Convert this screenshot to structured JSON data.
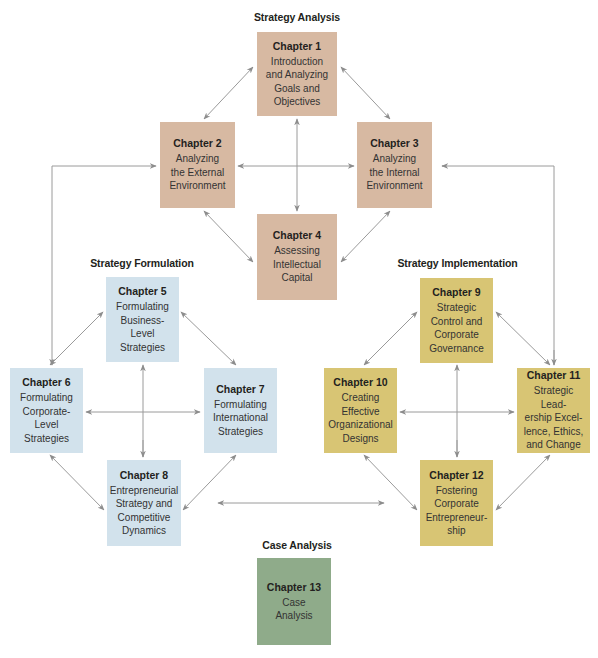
{
  "sections": {
    "analysis": "Strategy Analysis",
    "formulation": "Strategy Formulation",
    "implementation": "Strategy Implementation",
    "case": "Case Analysis"
  },
  "colors": {
    "analysis": "#d7b9a2",
    "formulation": "#d2e2ec",
    "implementation": "#d8c574",
    "case": "#8fab8a",
    "arrow": "#8c8c8c"
  },
  "chapters": [
    {
      "label": "Chapter 1",
      "desc": "Introduction\nand Analyzing\nGoals and\nObjectives"
    },
    {
      "label": "Chapter 2",
      "desc": "Analyzing\nthe External\nEnvironment"
    },
    {
      "label": "Chapter 3",
      "desc": "Analyzing\nthe Internal\nEnvironment"
    },
    {
      "label": "Chapter 4",
      "desc": "Assessing\nIntellectual\nCapital"
    },
    {
      "label": "Chapter 5",
      "desc": "Formulating\nBusiness-Level\nStrategies"
    },
    {
      "label": "Chapter 6",
      "desc": "Formulating\nCorporate-\nLevel\nStrategies"
    },
    {
      "label": "Chapter 7",
      "desc": "Formulating\nInternational\nStrategies"
    },
    {
      "label": "Chapter 8",
      "desc": "Entrepreneurial\nStrategy and\nCompetitive\nDynamics"
    },
    {
      "label": "Chapter 9",
      "desc": "Strategic\nControl and\nCorporate\nGovernance"
    },
    {
      "label": "Chapter 10",
      "desc": "Creating\nEffective\nOrganizational\nDesigns"
    },
    {
      "label": "Chapter 11",
      "desc": "Strategic Lead-\nership Excel-\nlence, Ethics,\nand Change"
    },
    {
      "label": "Chapter 12",
      "desc": "Fostering\nCorporate\nEntrepreneur-\nship"
    },
    {
      "label": "Chapter 13",
      "desc": "Case\nAnalysis"
    }
  ]
}
